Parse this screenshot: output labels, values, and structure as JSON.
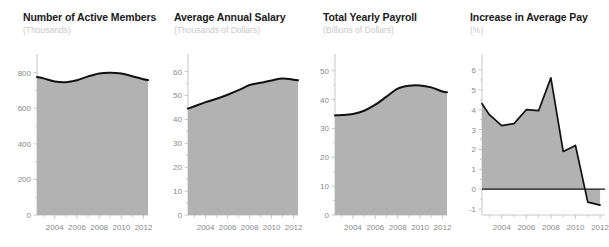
{
  "figure": {
    "background_color": "#ffffff",
    "area_fill_color": "#b2b2b2",
    "line_color": "#111111",
    "axis_color": "#c8c8c8",
    "tick_label_color": "#8a8a8a",
    "title_color": "#1a1a1a",
    "subtitle_color": "#c9c9c9"
  },
  "chart_data": [
    {
      "type": "area",
      "title": "Number of Active Members",
      "subtitle": "(Thousands)",
      "xlabel": "",
      "ylabel": "Thousands",
      "xlim": [
        2002.4,
        2012.4
      ],
      "ylim": [
        0,
        860
      ],
      "yticks": [
        0,
        200,
        400,
        600,
        800
      ],
      "ytick_labels": [
        "0",
        "200",
        "400",
        "600",
        "800"
      ],
      "xticks": [
        2004,
        2006,
        2008,
        2010,
        2012
      ],
      "xtick_labels": [
        "2004",
        "2006",
        "2008",
        "2010",
        "2012"
      ],
      "grid": false,
      "legend": "none",
      "x": [
        2002.4,
        2003,
        2004,
        2005,
        2006,
        2007,
        2008,
        2009,
        2010,
        2011,
        2012,
        2012.4
      ],
      "values": [
        776,
        768,
        750,
        746,
        757,
        779,
        796,
        800,
        795,
        780,
        763,
        759
      ]
    },
    {
      "type": "area",
      "title": "Average Annual Salary",
      "subtitle": "(Thousands of Dollars)",
      "xlabel": "",
      "ylabel": "Thousands of Dollars",
      "xlim": [
        2002.4,
        2012.4
      ],
      "ylim": [
        0,
        64
      ],
      "yticks": [
        0,
        10,
        20,
        30,
        40,
        50,
        60
      ],
      "ytick_labels": [
        "0",
        "10",
        "20",
        "30",
        "40",
        "50",
        "60"
      ],
      "xticks": [
        2004,
        2006,
        2008,
        2010,
        2012
      ],
      "xtick_labels": [
        "2004",
        "2006",
        "2008",
        "2010",
        "2012"
      ],
      "grid": false,
      "legend": "none",
      "x": [
        2002.4,
        2003,
        2004,
        2005,
        2006,
        2007,
        2008,
        2009,
        2010,
        2011,
        2012,
        2012.4
      ],
      "values": [
        44.5,
        45.5,
        47.2,
        48.6,
        50.3,
        52.2,
        54.4,
        55.3,
        56.3,
        57.1,
        56.6,
        56.4
      ]
    },
    {
      "type": "area",
      "title": "Total Yearly Payroll",
      "subtitle": "(Billions of Dollars)",
      "xlabel": "",
      "ylabel": "Billions of Dollars",
      "xlim": [
        2002.4,
        2012.4
      ],
      "ylim": [
        0,
        53
      ],
      "yticks": [
        0,
        10,
        20,
        30,
        40,
        50
      ],
      "ytick_labels": [
        "0",
        "10",
        "20",
        "30",
        "40",
        "50"
      ],
      "xticks": [
        2004,
        2006,
        2008,
        2010,
        2012
      ],
      "xtick_labels": [
        "2004",
        "2006",
        "2008",
        "2010",
        "2012"
      ],
      "grid": false,
      "legend": "none",
      "x": [
        2002.4,
        2003,
        2004,
        2005,
        2006,
        2007,
        2008,
        2009,
        2010,
        2011,
        2012,
        2012.4
      ],
      "values": [
        34.5,
        34.6,
        35.0,
        36.1,
        38.2,
        41.0,
        43.8,
        44.8,
        44.9,
        44.2,
        42.8,
        42.5
      ]
    },
    {
      "type": "area",
      "title": "Increase in Average Pay",
      "subtitle": "(%)",
      "xlabel": "",
      "ylabel": "%",
      "xlim": [
        2002.4,
        2012.4
      ],
      "ylim": [
        -1.3,
        6.4
      ],
      "yticks": [
        -1,
        0,
        1,
        2,
        3,
        4,
        5,
        6
      ],
      "ytick_labels": [
        "-1",
        "0",
        "1",
        "2",
        "3",
        "4",
        "5",
        "6"
      ],
      "xticks": [
        2004,
        2006,
        2008,
        2010,
        2012
      ],
      "xtick_labels": [
        "2004",
        "2006",
        "2008",
        "2010",
        "2012"
      ],
      "grid": false,
      "legend": "none",
      "zero_line": 0,
      "x": [
        2002.4,
        2003,
        2004,
        2005,
        2006,
        2007,
        2008,
        2009,
        2010,
        2011,
        2012
      ],
      "values": [
        4.3,
        3.75,
        3.2,
        3.3,
        4.0,
        3.95,
        5.6,
        1.9,
        2.2,
        -0.65,
        -0.8
      ]
    }
  ]
}
